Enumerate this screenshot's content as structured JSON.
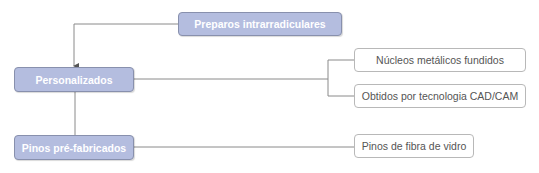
{
  "diagram": {
    "root": {
      "label": "Preparos intrarradiculares"
    },
    "categories": [
      {
        "label": "Personalizados",
        "children": [
          {
            "label": "Núcleos metálicos fundidos"
          },
          {
            "label": "Obtidos por tecnologia CAD/CAM"
          }
        ]
      },
      {
        "label": "Pinos pré-fabricados",
        "children": [
          {
            "label": "Pinos de fibra de vidro"
          }
        ]
      }
    ],
    "colors": {
      "main_fill": "#b4bddf",
      "main_border": "#8890ad",
      "leaf_border": "#b8b8b8",
      "line": "#8a8a8a"
    }
  }
}
